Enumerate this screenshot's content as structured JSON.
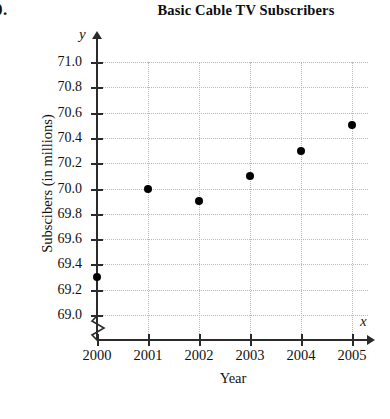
{
  "problem_number": "0.",
  "chart_data": {
    "type": "scatter",
    "title": "Basic Cable TV Subscribers",
    "xlabel": "Year",
    "ylabel": "Subscibers (in millions)",
    "x_axis_variable": "x",
    "y_axis_variable": "y",
    "categories": [
      "2000",
      "2001",
      "2002",
      "2003",
      "2004",
      "2005"
    ],
    "x": [
      2000,
      2001,
      2002,
      2003,
      2004,
      2005
    ],
    "values": [
      69.3,
      70.0,
      69.9,
      70.1,
      70.3,
      70.5
    ],
    "points": [
      {
        "x": "2000",
        "y": 69.3
      },
      {
        "x": "2001",
        "y": 70.0
      },
      {
        "x": "2002",
        "y": 69.9
      },
      {
        "x": "2003",
        "y": 70.1
      },
      {
        "x": "2004",
        "y": 70.3
      },
      {
        "x": "2005",
        "y": 70.5
      }
    ],
    "ylim": [
      69.0,
      71.0
    ],
    "ytick_labels": [
      "71.0",
      "70.8",
      "70.6",
      "70.4",
      "70.2",
      "70.0",
      "69.8",
      "69.6",
      "69.4",
      "69.2",
      "69.0"
    ],
    "ytick_values": [
      71.0,
      70.8,
      70.6,
      70.4,
      70.2,
      70.0,
      69.8,
      69.6,
      69.4,
      69.2,
      69.0
    ],
    "xlim": [
      2000,
      2005
    ],
    "grid": true,
    "grid_style": "dotted",
    "legend": null,
    "y_axis_break": true,
    "marker_color": "#000000",
    "grid_color": "#b9b9b9",
    "axis_color": "#2b2b2b"
  }
}
